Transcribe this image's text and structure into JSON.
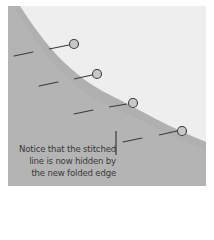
{
  "diagram": {
    "colors": {
      "background": "#ffffff",
      "panel_gray": "#b4b4b4",
      "folded_light": "#eeeeee",
      "stitch_dark": "#3c3c3c",
      "pin_fill": "#c8c8c8"
    },
    "annotation": {
      "lines": [
        "Notice that the stitched",
        "line is now hidden by",
        "the new folded edge"
      ]
    },
    "elements": {
      "fold_edge": "curved folded edge dividing light top-right from gray bottom-left",
      "pins": 4,
      "hidden_stitch_dashes": 4
    }
  }
}
